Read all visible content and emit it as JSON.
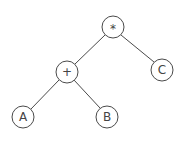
{
  "diagram": {
    "type": "expression-tree",
    "nodes": [
      {
        "id": "mul",
        "label": "*",
        "cx": 113,
        "cy": 27
      },
      {
        "id": "plus",
        "label": "+",
        "cx": 67,
        "cy": 72
      },
      {
        "id": "c",
        "label": "C",
        "cx": 162,
        "cy": 70
      },
      {
        "id": "a",
        "label": "A",
        "cx": 23,
        "cy": 117
      },
      {
        "id": "b",
        "label": "B",
        "cx": 107,
        "cy": 117
      }
    ],
    "edges": [
      {
        "from": "mul",
        "to": "plus"
      },
      {
        "from": "mul",
        "to": "c"
      },
      {
        "from": "plus",
        "to": "a"
      },
      {
        "from": "plus",
        "to": "b"
      }
    ],
    "node_radius": 11,
    "colors": {
      "stroke": "#4a4a4a",
      "text": "#444444",
      "background": "#ffffff"
    }
  }
}
